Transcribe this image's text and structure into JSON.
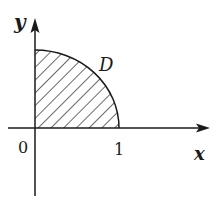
{
  "diagram": {
    "type": "quarter-disk region in first quadrant",
    "axes": {
      "x_label": "x",
      "y_label": "y",
      "origin_label": "0"
    },
    "ticks": {
      "x_tick_label": "1"
    },
    "region": {
      "label": "D",
      "fill": "diagonal hatching",
      "boundary": "quarter circle arc from (0,1) to (1,0)"
    },
    "colors": {
      "stroke": "#1a1a1a",
      "background": "#ffffff"
    }
  }
}
